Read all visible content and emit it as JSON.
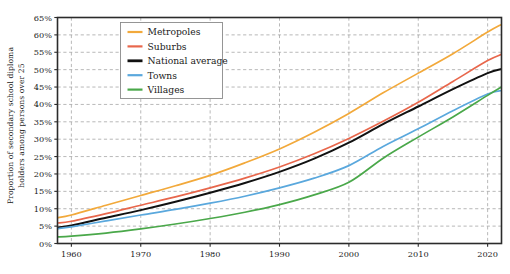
{
  "chart_data": {
    "type": "line",
    "title": "",
    "xlabel": "",
    "ylabel_line1": "Proportion of secondary school diploma",
    "ylabel_line2": "holders among persons over 25",
    "xlim": [
      1958,
      2022
    ],
    "ylim": [
      0,
      65
    ],
    "grid": true,
    "legend_position": "upper-left-inside",
    "xticks": [
      1960,
      1970,
      1980,
      1990,
      2000,
      2010,
      2020
    ],
    "xticklabels": [
      "1960",
      "1970",
      "1980",
      "1990",
      "2000",
      "2010",
      "2020"
    ],
    "yticks": [
      0,
      5,
      10,
      15,
      20,
      25,
      30,
      35,
      40,
      45,
      50,
      55,
      60,
      65
    ],
    "yticklabels": [
      "0%",
      "5%",
      "10%",
      "15%",
      "20%",
      "25%",
      "30%",
      "35%",
      "40%",
      "45%",
      "50%",
      "55%",
      "60%",
      "65%"
    ],
    "x": [
      1958,
      1960,
      1965,
      1970,
      1975,
      1980,
      1985,
      1990,
      1995,
      2000,
      2005,
      2010,
      2015,
      2020,
      2022
    ],
    "series": [
      {
        "name": "Metropoles",
        "color": "#f2a93b",
        "values": [
          7.4,
          8.2,
          11.0,
          13.8,
          16.6,
          19.6,
          23.2,
          27.2,
          32.0,
          37.4,
          43.4,
          49.0,
          54.6,
          60.8,
          63.0
        ]
      },
      {
        "name": "Suburbs",
        "color": "#e8674c",
        "values": [
          5.9,
          6.4,
          8.6,
          11.0,
          13.4,
          16.0,
          18.8,
          22.0,
          25.8,
          30.2,
          35.2,
          40.6,
          46.6,
          52.6,
          54.4
        ]
      },
      {
        "name": "National average",
        "color": "#111111",
        "values": [
          4.6,
          5.2,
          7.4,
          9.6,
          12.0,
          14.6,
          17.4,
          20.6,
          24.4,
          29.0,
          34.4,
          39.4,
          44.4,
          49.0,
          50.2
        ]
      },
      {
        "name": "Towns",
        "color": "#5aa8dd",
        "values": [
          4.3,
          4.8,
          6.5,
          8.2,
          9.8,
          11.6,
          13.6,
          16.0,
          18.8,
          22.4,
          28.0,
          33.0,
          38.2,
          43.0,
          44.0
        ]
      },
      {
        "name": "Villages",
        "color": "#4aa84a",
        "values": [
          1.9,
          2.1,
          3.0,
          4.2,
          5.6,
          7.2,
          9.0,
          11.2,
          14.0,
          17.6,
          24.6,
          30.6,
          36.4,
          42.6,
          45.0
        ]
      }
    ]
  },
  "legend": {
    "items": [
      {
        "label": "Metropoles"
      },
      {
        "label": "Suburbs"
      },
      {
        "label": "National average"
      },
      {
        "label": "Towns"
      },
      {
        "label": "Villages"
      }
    ]
  }
}
